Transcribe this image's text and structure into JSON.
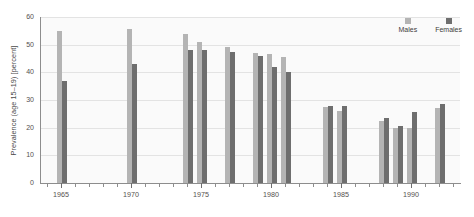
{
  "chart_data": {
    "type": "bar",
    "title": "",
    "xlabel": "",
    "ylabel": "Prevalence (age 15–19) [percent]",
    "ylim": [
      0,
      60
    ],
    "ytick_labels": [
      "0",
      "10",
      "20",
      "30",
      "40",
      "50",
      "60"
    ],
    "ytick_values": [
      0,
      10,
      20,
      30,
      40,
      50,
      60
    ],
    "xlim": [
      1963.5,
      1993.5
    ],
    "xtick_labels": [
      "1965",
      "1970",
      "1975",
      "1980",
      "1985",
      "1990"
    ],
    "xtick_values": [
      1965,
      1970,
      1975,
      1980,
      1985,
      1990
    ],
    "grid": true,
    "legend_position": "top-right",
    "categories": [
      1965,
      1970,
      1974,
      1975,
      1977,
      1979,
      1980,
      1981,
      1984,
      1985,
      1988,
      1989,
      1990,
      1992
    ],
    "series": [
      {
        "name": "Males",
        "color": "#b4b4b4",
        "values": [
          55.0,
          55.5,
          54.0,
          51.0,
          49.0,
          47.0,
          46.5,
          45.5,
          27.5,
          26.0,
          22.5,
          20.0,
          20.0,
          27.0
        ]
      },
      {
        "name": "Females",
        "color": "#6e6e6e",
        "values": [
          37.0,
          43.0,
          48.0,
          48.0,
          47.5,
          46.0,
          42.0,
          40.0,
          28.0,
          28.0,
          23.5,
          20.5,
          25.5,
          28.5
        ]
      }
    ]
  },
  "legend": {
    "items": [
      {
        "label": "Males",
        "color": "#b4b4b4"
      },
      {
        "label": "Females",
        "color": "#6e6e6e"
      }
    ]
  },
  "axes": {
    "y_title": "Prevalence (age 15–19) [percent]"
  }
}
